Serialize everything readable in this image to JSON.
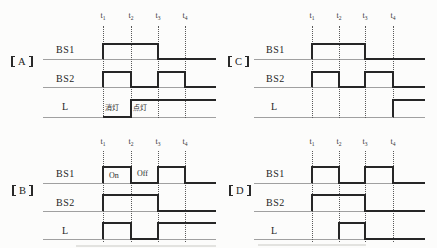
{
  "figure": {
    "width": 437,
    "height": 248,
    "background": "#fcfcfb",
    "waveform_color": "#262626",
    "baseline_color": "#a0a0a0",
    "dotted_line_color": "#595959",
    "text_color": "#222222"
  },
  "panels": [
    {
      "name": "panel-A",
      "label": "A",
      "label_full": "【A】",
      "label_pos": {
        "x": 11,
        "y": 56
      },
      "time_label_y": 12,
      "times": [
        {
          "tag": "t",
          "sub": "1",
          "x": 103
        },
        {
          "tag": "t",
          "sub": "2",
          "x": 131
        },
        {
          "tag": "t",
          "sub": "3",
          "x": 158
        },
        {
          "tag": "t",
          "sub": "4",
          "x": 185
        }
      ],
      "dotted": {
        "top": 26,
        "bottom": 118
      },
      "line_x": {
        "start": 43,
        "end": 216
      },
      "rows": [
        {
          "label": "BS1",
          "label_pos": {
            "x": 56,
            "y": 45
          },
          "base_y": 59,
          "high_y": 44,
          "trace": {
            "start": 103,
            "end": 216
          },
          "high_segments": [
            [
              103,
              158
            ]
          ],
          "annotations": []
        },
        {
          "label": "BS2",
          "label_pos": {
            "x": 56,
            "y": 74
          },
          "base_y": 87,
          "high_y": 72,
          "trace": {
            "start": 103,
            "end": 216
          },
          "high_segments": [
            [
              103,
              131
            ],
            [
              158,
              185
            ]
          ],
          "annotations": []
        },
        {
          "label": "L",
          "label_pos": {
            "x": 62,
            "y": 102
          },
          "base_y": 117,
          "high_y": 100,
          "trace": {
            "start": 103,
            "end": 216
          },
          "high_segments": [
            [
              131,
              216
            ]
          ],
          "annotations": [
            {
              "text": "消灯",
              "x": 105,
              "y": 104,
              "lang": "cjk"
            },
            {
              "text": "点灯",
              "x": 133,
              "y": 104,
              "lang": "cjk"
            }
          ]
        }
      ]
    },
    {
      "name": "panel-C",
      "label": "C",
      "label_full": "【C】",
      "label_pos": {
        "x": 228,
        "y": 56
      },
      "time_label_y": 12,
      "times": [
        {
          "tag": "t",
          "sub": "1",
          "x": 312
        },
        {
          "tag": "t",
          "sub": "2",
          "x": 339
        },
        {
          "tag": "t",
          "sub": "3",
          "x": 365
        },
        {
          "tag": "t",
          "sub": "4",
          "x": 393
        }
      ],
      "dotted": {
        "top": 26,
        "bottom": 118
      },
      "line_x": {
        "start": 254,
        "end": 425
      },
      "rows": [
        {
          "label": "BS1",
          "label_pos": {
            "x": 266,
            "y": 45
          },
          "base_y": 59,
          "high_y": 44,
          "trace": {
            "start": 312,
            "end": 425
          },
          "high_segments": [
            [
              312,
              365
            ]
          ],
          "annotations": []
        },
        {
          "label": "BS2",
          "label_pos": {
            "x": 266,
            "y": 74
          },
          "base_y": 87,
          "high_y": 72,
          "trace": {
            "start": 312,
            "end": 425
          },
          "high_segments": [
            [
              312,
              339
            ],
            [
              365,
              393
            ]
          ],
          "annotations": []
        },
        {
          "label": "L",
          "label_pos": {
            "x": 271,
            "y": 102
          },
          "base_y": 117,
          "high_y": 100,
          "trace": {
            "start": 393,
            "end": 425
          },
          "high_segments": [
            [
              393,
              425
            ]
          ],
          "annotations": []
        }
      ]
    },
    {
      "name": "panel-B",
      "label": "B",
      "label_full": "【B】",
      "label_pos": {
        "x": 12,
        "y": 185
      },
      "time_label_y": 138,
      "times": [
        {
          "tag": "t",
          "sub": "1",
          "x": 103
        },
        {
          "tag": "t",
          "sub": "2",
          "x": 131
        },
        {
          "tag": "t",
          "sub": "3",
          "x": 158
        },
        {
          "tag": "t",
          "sub": "4",
          "x": 185
        }
      ],
      "dotted": {
        "top": 151,
        "bottom": 242
      },
      "line_x": {
        "start": 43,
        "end": 216
      },
      "rows": [
        {
          "label": "BS1",
          "label_pos": {
            "x": 56,
            "y": 169
          },
          "base_y": 183,
          "high_y": 167,
          "trace": {
            "start": 103,
            "end": 216
          },
          "high_segments": [
            [
              103,
              131
            ],
            [
              158,
              185
            ]
          ],
          "annotations": [
            {
              "text": "On",
              "x": 109,
              "y": 171,
              "lang": "latin"
            },
            {
              "text": "Off",
              "x": 137,
              "y": 169,
              "lang": "latin"
            }
          ]
        },
        {
          "label": "BS2",
          "label_pos": {
            "x": 56,
            "y": 198
          },
          "base_y": 211,
          "high_y": 195,
          "trace": {
            "start": 103,
            "end": 216
          },
          "high_segments": [
            [
              103,
              158
            ]
          ],
          "annotations": []
        },
        {
          "label": "L",
          "label_pos": {
            "x": 62,
            "y": 226
          },
          "base_y": 239,
          "high_y": 223,
          "trace": {
            "start": 103,
            "end": 216
          },
          "high_segments": [
            [
              103,
              131
            ],
            [
              158,
              216
            ]
          ],
          "annotations": []
        }
      ]
    },
    {
      "name": "panel-D",
      "label": "D",
      "label_full": "【D】",
      "label_pos": {
        "x": 229,
        "y": 185
      },
      "time_label_y": 138,
      "times": [
        {
          "tag": "t",
          "sub": "1",
          "x": 312
        },
        {
          "tag": "t",
          "sub": "2",
          "x": 339
        },
        {
          "tag": "t",
          "sub": "3",
          "x": 365
        },
        {
          "tag": "t",
          "sub": "4",
          "x": 393
        }
      ],
      "dotted": {
        "top": 151,
        "bottom": 242
      },
      "line_x": {
        "start": 254,
        "end": 425
      },
      "rows": [
        {
          "label": "BS1",
          "label_pos": {
            "x": 266,
            "y": 169
          },
          "base_y": 183,
          "high_y": 167,
          "trace": {
            "start": 312,
            "end": 425
          },
          "high_segments": [
            [
              312,
              339
            ],
            [
              365,
              393
            ]
          ],
          "annotations": []
        },
        {
          "label": "BS2",
          "label_pos": {
            "x": 266,
            "y": 198
          },
          "base_y": 211,
          "high_y": 195,
          "trace": {
            "start": 312,
            "end": 425
          },
          "high_segments": [
            [
              312,
              365
            ]
          ],
          "annotations": []
        },
        {
          "label": "L",
          "label_pos": {
            "x": 271,
            "y": 226
          },
          "base_y": 239,
          "high_y": 223,
          "trace": {
            "start": 339,
            "end": 425
          },
          "high_segments": [
            [
              339,
              365
            ]
          ],
          "annotations": []
        }
      ]
    }
  ]
}
